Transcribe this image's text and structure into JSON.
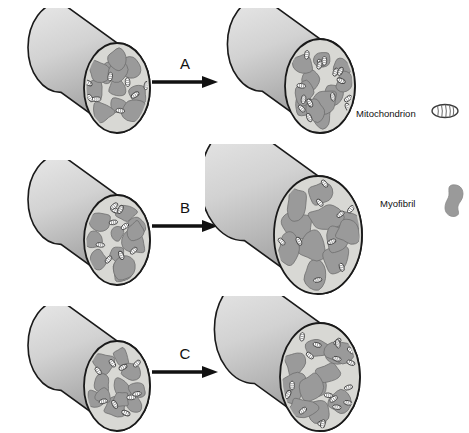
{
  "diagram": {
    "background_color": "#ffffff",
    "colors": {
      "cylinder_body_light": "#e8e8e8",
      "cylinder_body_dark": "#9a9a9a",
      "cylinder_face": "#d8d8d4",
      "myofibril_fill": "#9a9a9a",
      "myofibril_stroke": "#6e6e6e",
      "mitochondrion_fill": "#ffffff",
      "mitochondrion_stroke": "#444444",
      "outline": "#1a1a1a",
      "text": "#111111"
    }
  },
  "rows": [
    {
      "id": "row-a",
      "arrow_label": "A",
      "before": {
        "name": "muscle-fiber-before-a",
        "radius_x": 33,
        "radius_y": 45,
        "length": 70,
        "myofibril_count": 11,
        "mitochondrion_count": 8
      },
      "after": {
        "name": "muscle-fiber-after-a",
        "radius_x": 35,
        "radius_y": 47,
        "length": 72,
        "myofibril_count": 11,
        "mitochondrion_count": 15
      }
    },
    {
      "id": "row-b",
      "arrow_label": "B",
      "before": {
        "name": "muscle-fiber-before-b",
        "radius_x": 33,
        "radius_y": 45,
        "length": 70,
        "myofibril_count": 11,
        "mitochondrion_count": 9
      },
      "after": {
        "name": "muscle-fiber-after-b",
        "radius_x": 44,
        "radius_y": 59,
        "length": 92,
        "myofibril_count": 11,
        "mitochondrion_count": 9
      }
    },
    {
      "id": "row-c",
      "arrow_label": "C",
      "before": {
        "name": "muscle-fiber-before-c",
        "radius_x": 33,
        "radius_y": 45,
        "length": 70,
        "myofibril_count": 11,
        "mitochondrion_count": 9
      },
      "after": {
        "name": "muscle-fiber-after-c",
        "radius_x": 40,
        "radius_y": 54,
        "length": 82,
        "myofibril_count": 11,
        "mitochondrion_count": 18
      }
    }
  ],
  "legend": {
    "items": [
      {
        "label": "Mitochondrion",
        "icon": "mitochondrion-icon"
      },
      {
        "label": "Myofibril",
        "icon": "myofibril-icon"
      }
    ]
  }
}
